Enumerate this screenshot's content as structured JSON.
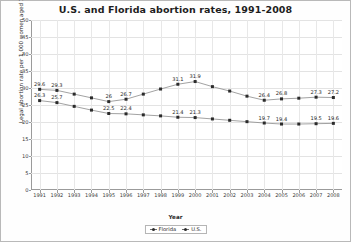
{
  "chart_data": {
    "type": "line",
    "title": "U.S. and Florida abortion rates, 1991-2008",
    "xlabel": "Year",
    "ylabel": "Legal abortion rate per 1,000 women aged 15-44",
    "ylim": [
      0,
      50
    ],
    "ytick_labels": [
      "50",
      "45",
      "40",
      "35",
      "30",
      "25",
      "20",
      "15",
      "10",
      "5",
      "0"
    ],
    "ytick_values": [
      50,
      45,
      40,
      35,
      30,
      25,
      20,
      15,
      10,
      5,
      0
    ],
    "grid": true,
    "legend_position": "bottom",
    "categories": [
      "1991",
      "1992",
      "1993",
      "1994",
      "1995",
      "1996",
      "1997",
      "1998",
      "1999",
      "2000",
      "2001",
      "2002",
      "2003",
      "2004",
      "2005",
      "2006",
      "2007",
      "2008"
    ],
    "series": [
      {
        "name": "Florida",
        "color": "#2b2b2b",
        "values": [
          26.3,
          25.7,
          24.6,
          23.5,
          22.5,
          22.4,
          22.1,
          21.8,
          21.4,
          21.3,
          20.9,
          20.5,
          20.1,
          19.7,
          19.4,
          19.4,
          19.5,
          19.6
        ],
        "labels": [
          "26.3",
          "25.7",
          "",
          "",
          "22.5",
          "22.4",
          "",
          "",
          "21.4",
          "21.3",
          "",
          "",
          "",
          "19.7",
          "19.4",
          "",
          "19.5",
          "19.6"
        ]
      },
      {
        "name": "U.S.",
        "color": "#2b2b2b",
        "values": [
          29.6,
          29.3,
          28.2,
          27.1,
          26.0,
          26.7,
          28.2,
          29.7,
          31.1,
          31.9,
          30.4,
          29.1,
          27.6,
          26.4,
          26.8,
          27.0,
          27.3,
          27.2
        ],
        "labels": [
          "29.6",
          "29.3",
          "",
          "",
          "26",
          "26.7",
          "",
          "",
          "31.1",
          "31.9",
          "",
          "",
          "",
          "26.4",
          "26.8",
          "",
          "27.3",
          "27.2"
        ]
      }
    ]
  },
  "legend": {
    "items": [
      {
        "label": "Florida"
      },
      {
        "label": "U.S."
      }
    ]
  }
}
